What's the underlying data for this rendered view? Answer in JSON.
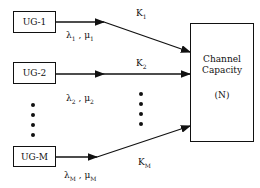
{
  "diagram": {
    "sources": [
      {
        "label": "UG-1",
        "rate_label": "λ1 , μ1",
        "lambda": "λ",
        "lambda_sub": "1",
        "mu": "μ",
        "mu_sub": "1",
        "link_label": "K",
        "link_sub": "1"
      },
      {
        "label": "UG-2",
        "rate_label": "λ2 , μ2",
        "lambda": "λ",
        "lambda_sub": "2",
        "mu": "μ",
        "mu_sub": "2",
        "link_label": "K",
        "link_sub": "2"
      },
      {
        "label": "UG-M",
        "rate_label": "λM , μM",
        "lambda": "λ",
        "lambda_sub": "M",
        "mu": "μ",
        "mu_sub": "M",
        "link_label": "K",
        "link_sub": "M"
      }
    ],
    "sink": {
      "line1": "Channel",
      "line2": "Capacity",
      "line3": "(N)"
    },
    "separator": ","
  }
}
